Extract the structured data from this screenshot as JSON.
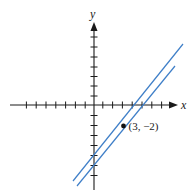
{
  "figure": {
    "axes": {
      "x_label": "x",
      "y_label": "y",
      "origin_px": [
        94,
        105
      ],
      "unit_px": 9.8,
      "x_ticks_left": 7,
      "x_ticks_right": 8,
      "y_ticks_up": 7,
      "y_ticks_down": 7
    },
    "point": {
      "label": "(3, −2)",
      "coords": [
        3,
        -2
      ]
    },
    "lines": [
      {
        "name": "line-1",
        "from_px": [
          183,
          44
        ],
        "to_px": [
          73,
          181
        ],
        "color": "#3f7fc8"
      },
      {
        "name": "line-2",
        "from_px": [
          175,
          66
        ],
        "to_px": [
          77,
          186
        ],
        "color": "#3f7fc8"
      }
    ],
    "colors": {
      "axis": "#1a1a1a",
      "lines": "#3f7fc8"
    }
  }
}
